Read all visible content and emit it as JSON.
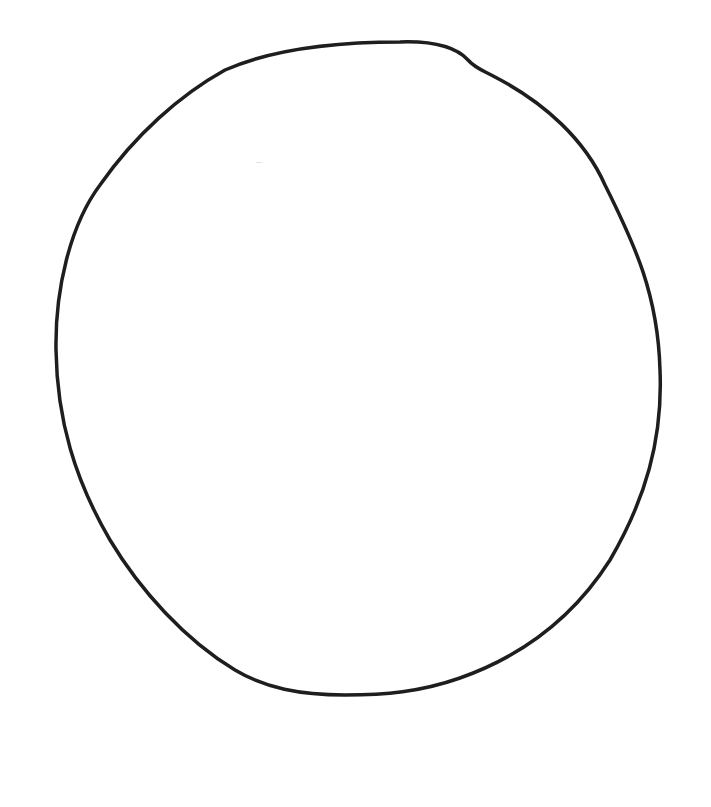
{
  "drawing": {
    "subject": "circle outline",
    "style": "hand-drawn line art",
    "stroke_color": "#1e1e1e",
    "background_color": "#ffffff",
    "stroke_width": 3.5,
    "bounds": {
      "left": 56,
      "top": 41,
      "right": 661,
      "bottom": 695
    }
  }
}
